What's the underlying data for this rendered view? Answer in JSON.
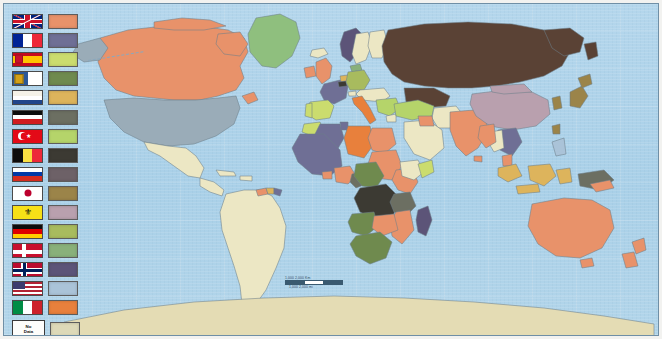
{
  "map": {
    "title": "World map of colonial empires and spheres of influence",
    "projection_note": "Equirectangular world map",
    "ocean_color": "#aed3ea",
    "border_color": "#6d7f8a",
    "no_data_color": "#ece7c4",
    "antarctica_color": "#e4dcb4"
  },
  "scale_bar": {
    "km_label": "1,000   2,000 Km",
    "mi_label": "1,000      2,000 mi",
    "zero_label": "0"
  },
  "legend": {
    "no_data_line1": "No",
    "no_data_line2": "Data",
    "entries": [
      {
        "country": "United Kingdom",
        "flag": "uk-flag",
        "color": "#e8926a"
      },
      {
        "country": "France",
        "flag": "france-flag",
        "color": "#6f6f95"
      },
      {
        "country": "Spain",
        "flag": "spain-flag",
        "color": "#cbdc6e"
      },
      {
        "country": "Malta",
        "flag": "malta-flag",
        "color": "#6f8a4e"
      },
      {
        "country": "Netherlands",
        "flag": "netherlands-flag",
        "color": "#ddb45c"
      },
      {
        "country": "German Empire",
        "flag": "german-empire-flag",
        "color": "#6c6f62"
      },
      {
        "country": "Turkey",
        "flag": "turkey-flag",
        "color": "#b5d46a"
      },
      {
        "country": "Belgium",
        "flag": "belgium-flag",
        "color": "#3c3a33"
      },
      {
        "country": "Russia",
        "flag": "russia-flag",
        "color": "#6d6167"
      },
      {
        "country": "Japan",
        "flag": "japan-flag",
        "color": "#9b8449"
      },
      {
        "country": "Brunei",
        "flag": "brunei-flag",
        "color": "#b9a0ae"
      },
      {
        "country": "Germany",
        "flag": "germany-flag",
        "color": "#a8bb5e"
      },
      {
        "country": "Denmark",
        "flag": "denmark-flag",
        "color": "#89b07a"
      },
      {
        "country": "Norway",
        "flag": "norway-flag",
        "color": "#5c5478"
      },
      {
        "country": "United States",
        "flag": "usa-flag",
        "color": "#aac3d8"
      },
      {
        "country": "Italy",
        "flag": "italy-flag",
        "color": "#e8803c"
      },
      {
        "country": "No Data",
        "flag": "no-data-box",
        "color": "#ddd9b8"
      }
    ]
  }
}
